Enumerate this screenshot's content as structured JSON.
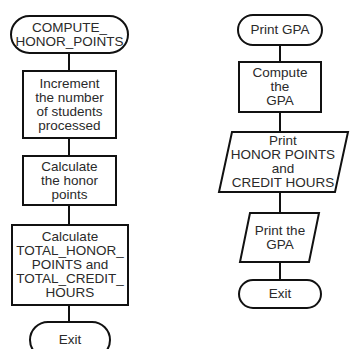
{
  "left_flowchart": {
    "start": "COMPUTE_\nHONOR_POINTS",
    "step1": "Increment\nthe number\nof students\nprocessed",
    "step2": "Calculate\nthe honor\npoints",
    "step3": "Calculate\nTOTAL_HONOR_\nPOINTS and\nTOTAL_CREDIT_\nHOURS",
    "end": "Exit"
  },
  "right_flowchart": {
    "start": "Print GPA",
    "step1": "Compute\nthe\nGPA",
    "output1": "Print\nHONOR POINTS\nand\nCREDIT HOURS",
    "output2": "Print the\nGPA",
    "end": "Exit"
  },
  "colors": {
    "stroke": "#111111",
    "text": "#2a2a2a",
    "background": "#ffffff"
  }
}
